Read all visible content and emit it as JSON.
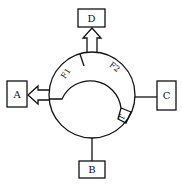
{
  "diagram": {
    "colors": {
      "stroke": "#111111",
      "background": "#ffffff"
    },
    "boxes": [
      {
        "id": "A",
        "label": "A",
        "position": "left",
        "connection": "hollow-arrow-out"
      },
      {
        "id": "B",
        "label": "B",
        "position": "bottom",
        "connection": "line"
      },
      {
        "id": "C",
        "label": "C",
        "position": "right",
        "connection": "line"
      },
      {
        "id": "D",
        "label": "D",
        "position": "top",
        "connection": "hollow-arrow-out"
      }
    ],
    "band_segments": [
      {
        "id": "F1",
        "label": "F1"
      },
      {
        "id": "F2",
        "label": "F2"
      },
      {
        "id": "T",
        "label": "T"
      }
    ]
  }
}
